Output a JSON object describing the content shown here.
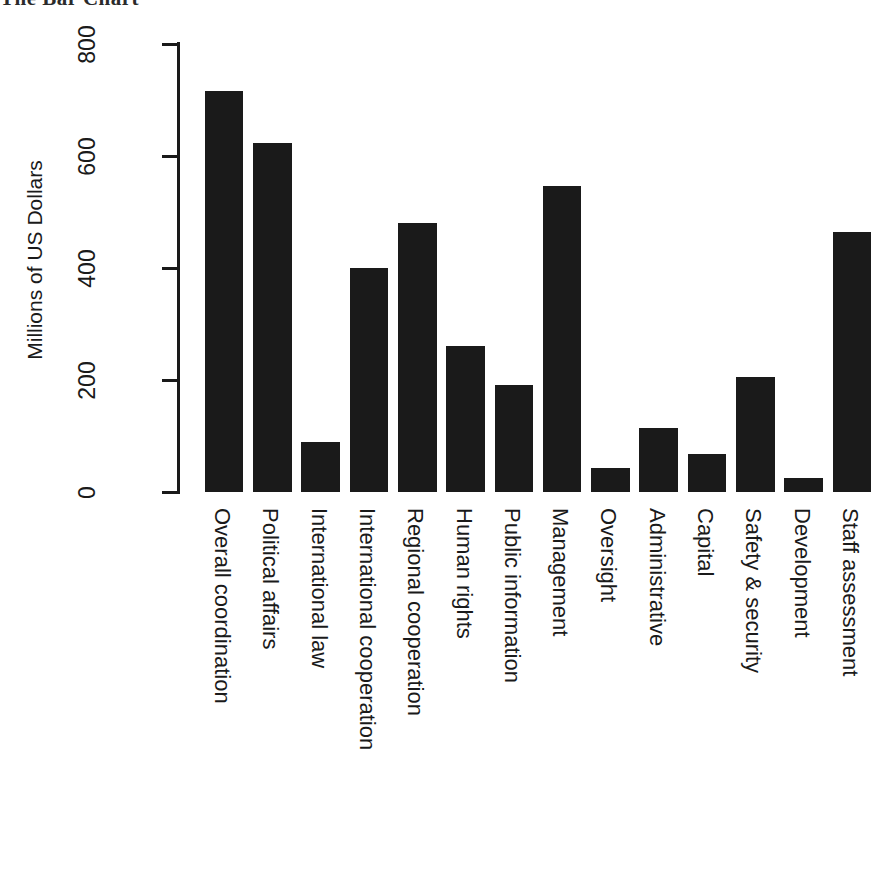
{
  "chart_data": {
    "type": "bar",
    "title": "The Bar Chart",
    "xlabel": "",
    "ylabel": "Millions of US Dollars",
    "ylim": [
      0,
      800
    ],
    "yticks": [
      0,
      200,
      400,
      600,
      800
    ],
    "grid": false,
    "legend": null,
    "orientation": "vertical",
    "bar_color": "#1a1a1a",
    "categories": [
      "Overall coordination",
      "Political affairs",
      "International law",
      "International cooperation",
      "Regional cooperation",
      "Human rights",
      "Public information",
      "Management",
      "Oversight",
      "Administrative",
      "Capital",
      "Safety & security",
      "Development",
      "Staff assessment"
    ],
    "values": [
      716,
      623,
      90,
      400,
      480,
      261,
      191,
      546,
      43,
      115,
      68,
      205,
      25,
      464
    ]
  },
  "axis": {
    "y_tick_labels": [
      "0",
      "200",
      "400",
      "600",
      "800"
    ],
    "y_axis_title": "Millions of US Dollars"
  },
  "title": {
    "text": "The Bar Chart"
  }
}
